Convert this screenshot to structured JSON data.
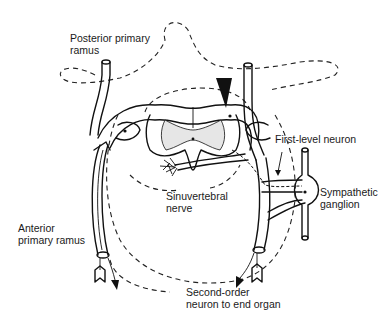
{
  "figure": {
    "type": "anatomical-diagram",
    "labels": {
      "posterior_primary_ramus": "Posterior primary\nramus",
      "first_level_neuron": "First-level neuron",
      "sympathetic_ganglion": "Sympathetic\nganglion",
      "sinuvertebral_nerve": "Sinuvertebral\nnerve",
      "anterior_primary_ramus": "Anterior\nprimary ramus",
      "second_order_neuron": "Second-order\nneuron to end organ"
    },
    "colors": {
      "line": "#111111",
      "background": "#ffffff",
      "gray_matter": "#e6e6e6"
    }
  }
}
